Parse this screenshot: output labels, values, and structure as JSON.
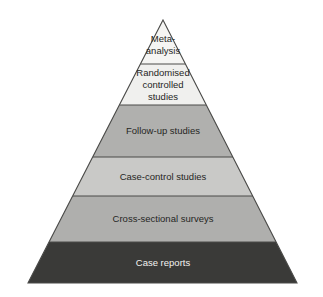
{
  "diagram": {
    "name": "evidence-hierarchy-pyramid",
    "type": "pyramid",
    "apex": {
      "x": 163,
      "y": 20
    },
    "base": {
      "left_x": 28,
      "right_x": 297,
      "y": 283
    },
    "background_color": "#ffffff",
    "outline_color": "#4a4a48",
    "tiers": [
      {
        "id": "meta-analysis",
        "rank": 1,
        "lines": [
          "Meta-",
          "analysis"
        ],
        "fill": "#f5f5f3",
        "text_color": "#262624",
        "font_size": 9.5,
        "top_y": 20,
        "bottom_y": 64,
        "center_y": 45
      },
      {
        "id": "randomised-controlled-studies",
        "rank": 2,
        "lines": [
          "Randomised",
          "controlled",
          "studies"
        ],
        "fill": "#f0f0ee",
        "text_color": "#262624",
        "font_size": 9.5,
        "top_y": 64,
        "bottom_y": 105,
        "center_y": 85
      },
      {
        "id": "follow-up-studies",
        "rank": 3,
        "lines": [
          "Follow-up studies"
        ],
        "fill": "#b0b0ae",
        "text_color": "#262624",
        "font_size": 9.5,
        "top_y": 105,
        "bottom_y": 157,
        "center_y": 131
      },
      {
        "id": "case-control-studies",
        "rank": 4,
        "lines": [
          "Case-control studies"
        ],
        "fill": "#c9c9c7",
        "text_color": "#262624",
        "font_size": 9.5,
        "top_y": 157,
        "bottom_y": 196,
        "center_y": 177
      },
      {
        "id": "cross-sectional-surveys",
        "rank": 5,
        "lines": [
          "Cross-sectional surveys"
        ],
        "fill": "#afafad",
        "text_color": "#262624",
        "font_size": 9.5,
        "top_y": 196,
        "bottom_y": 242,
        "center_y": 219
      },
      {
        "id": "case-reports",
        "rank": 6,
        "lines": [
          "Case reports"
        ],
        "fill": "#3a3a38",
        "text_color": "#f2f2f0",
        "font_size": 9.5,
        "top_y": 242,
        "bottom_y": 283,
        "center_y": 263
      }
    ]
  }
}
